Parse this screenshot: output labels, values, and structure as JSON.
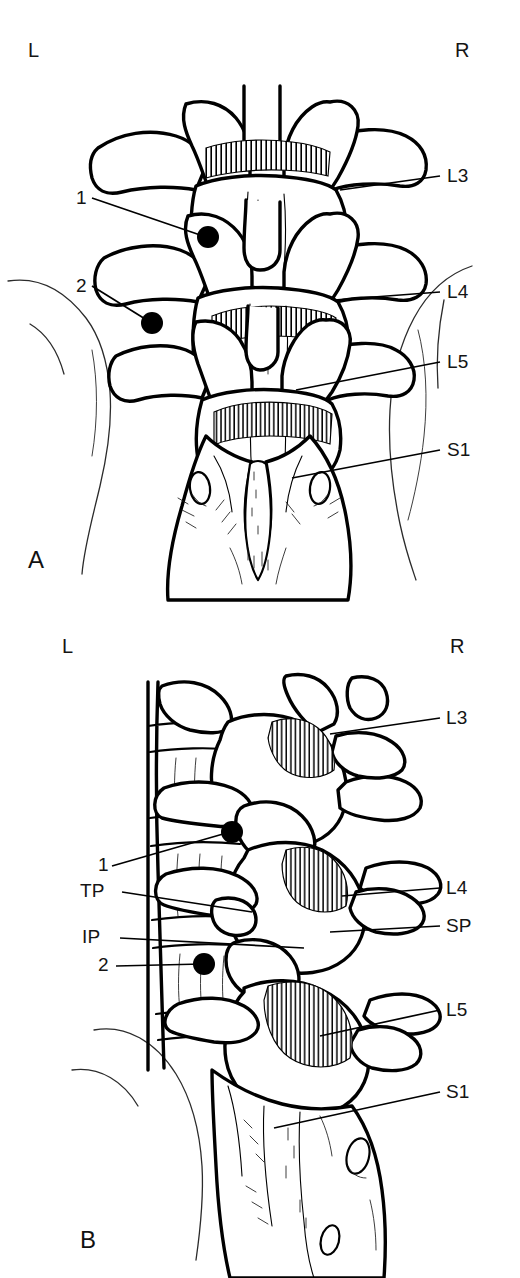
{
  "figure": {
    "caption_fragment": "",
    "panels": [
      {
        "id": "A",
        "letter": "A",
        "view": "posterior",
        "orientation": {
          "left": "L",
          "right": "R"
        },
        "labels": [
          {
            "key": "num1",
            "text": "1",
            "side": "left"
          },
          {
            "key": "num2",
            "text": "2",
            "side": "left"
          },
          {
            "key": "l3",
            "text": "L3",
            "side": "right"
          },
          {
            "key": "l4",
            "text": "L4",
            "side": "right"
          },
          {
            "key": "l5",
            "text": "L5",
            "side": "right"
          },
          {
            "key": "s1",
            "text": "S1",
            "side": "right"
          }
        ]
      },
      {
        "id": "B",
        "letter": "B",
        "view": "oblique",
        "orientation": {
          "left": "L",
          "right": "R"
        },
        "labels": [
          {
            "key": "num1",
            "text": "1",
            "side": "left"
          },
          {
            "key": "tp",
            "text": "TP",
            "side": "left"
          },
          {
            "key": "ip",
            "text": "IP",
            "side": "left"
          },
          {
            "key": "num2",
            "text": "2",
            "side": "left"
          },
          {
            "key": "l3",
            "text": "L3",
            "side": "right"
          },
          {
            "key": "l4",
            "text": "L4",
            "side": "right"
          },
          {
            "key": "sp",
            "text": "SP",
            "side": "right"
          },
          {
            "key": "l5",
            "text": "L5",
            "side": "right"
          },
          {
            "key": "s1",
            "text": "S1",
            "side": "right"
          }
        ]
      }
    ]
  },
  "panel_a": {
    "letter": "A",
    "left_marker": "L",
    "right_marker": "R",
    "callout_1": "1",
    "callout_2": "2",
    "level_l3": "L3",
    "level_l4": "L4",
    "level_l5": "L5",
    "level_s1": "S1"
  },
  "panel_b": {
    "letter": "B",
    "left_marker": "L",
    "right_marker": "R",
    "callout_1": "1",
    "callout_2": "2",
    "transverse_process": "TP",
    "inferior_process": "IP",
    "spinous_process": "SP",
    "level_l3": "L3",
    "level_l4": "L4",
    "level_l5": "L5",
    "level_s1": "S1"
  },
  "colors": {
    "ink": "#000000",
    "paper": "#ffffff",
    "label_text": "#141414"
  }
}
